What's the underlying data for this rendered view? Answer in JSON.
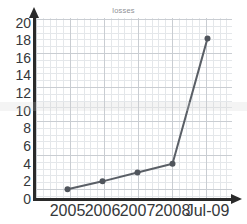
{
  "chart_data": {
    "type": "line",
    "title": "losses",
    "xlabel": "",
    "ylabel": "",
    "categories": [
      "2005",
      "2006",
      "2007",
      "2008",
      "Jul-09"
    ],
    "values": [
      1.1,
      2.0,
      3.0,
      4.0,
      18.2
    ],
    "series": [
      {
        "name": "losses",
        "values": [
          1.1,
          2.0,
          3.0,
          4.0,
          18.2
        ]
      }
    ],
    "ylim": [
      0,
      20
    ],
    "yticks": [
      0,
      2,
      4,
      6,
      8,
      10,
      12,
      14,
      16,
      18,
      20
    ],
    "ytick_labels": [
      "0",
      "2",
      "4",
      "6",
      "8",
      "10",
      "12",
      "14",
      "16",
      "18",
      "20"
    ],
    "xtick_labels": [
      "2005",
      "2006",
      "2007",
      "2008",
      "Jul-09"
    ],
    "grid": true,
    "grid_style": "graph-paper",
    "legend": false,
    "legend_position": "none",
    "markers": true,
    "colors": {
      "line": "#5a5f66",
      "marker": "#50555c",
      "axis": "#2a2a2a",
      "grid_major": "#c9cdd2",
      "grid_minor": "#e4e7ea",
      "title_text": "#8e9195",
      "tick_text": "#35383b",
      "background": "#ffffff"
    },
    "annotations": []
  }
}
